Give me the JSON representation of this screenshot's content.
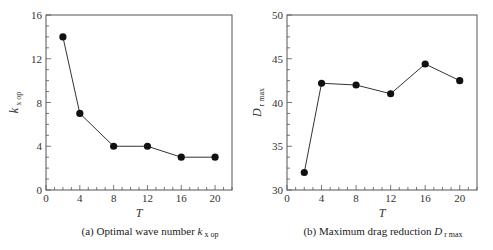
{
  "chart_data": [
    {
      "type": "line",
      "title": "(a) Optimal wave number k x op",
      "caption_main": "(a) Optimal wave number ",
      "caption_var": "k",
      "caption_sub": "x op",
      "xlabel": "T",
      "ylabel_var": "k",
      "ylabel_sub": "x op",
      "x": [
        2,
        4,
        8,
        12,
        16,
        20
      ],
      "values": [
        14,
        7,
        4,
        4,
        3,
        3
      ],
      "xlim": [
        0,
        22
      ],
      "ylim": [
        0,
        16
      ],
      "xticks": [
        0,
        4,
        8,
        12,
        16,
        20
      ],
      "yticks": [
        0,
        4,
        8,
        12,
        16
      ],
      "grid": false,
      "marker": "filled-circle"
    },
    {
      "type": "line",
      "title": "(b) Maximum drag reduction D r max",
      "caption_main": "(b) Maximum drag reduction ",
      "caption_var": "D",
      "caption_sub": "r max",
      "xlabel": "T",
      "ylabel_var": "D",
      "ylabel_sub": "r max",
      "x": [
        2,
        4,
        8,
        12,
        16,
        20
      ],
      "values": [
        32.0,
        42.2,
        42.0,
        41.0,
        44.4,
        42.5
      ],
      "xlim": [
        0,
        22
      ],
      "ylim": [
        30,
        50
      ],
      "xticks": [
        0,
        4,
        8,
        12,
        16,
        20
      ],
      "yticks": [
        30,
        35,
        40,
        45,
        50
      ],
      "grid": false,
      "marker": "filled-circle"
    }
  ]
}
